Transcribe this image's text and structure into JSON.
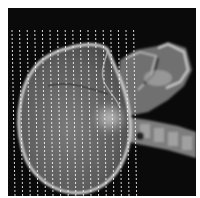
{
  "image": {
    "subject": "lateral skull X-ray with vertical dashed line overlay",
    "colors": {
      "background": "#0a0a0a",
      "skull_fill": "#6e6e6e",
      "skull_edge": "#d8d8d8",
      "face": "#8a8a8a",
      "spine": "#9a9a9a",
      "dash": "#ffffff"
    },
    "dashed_lines": {
      "count": 17,
      "start_x": 4,
      "spacing": 7.6,
      "top_y": 22,
      "bottom_y": 188
    }
  }
}
